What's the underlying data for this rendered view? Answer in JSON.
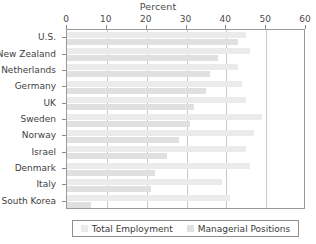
{
  "chart_data": {
    "type": "bar",
    "orientation": "horizontal",
    "title": "Percent",
    "xlabel": "",
    "ylabel": "",
    "xlim": [
      0,
      60
    ],
    "xticks": [
      0,
      10,
      20,
      30,
      40,
      50,
      60
    ],
    "xtick_labels": [
      "0",
      "10",
      "20",
      "30",
      "40",
      "50",
      "60"
    ],
    "grid": true,
    "grid_axis": "x",
    "legend_position": "bottom",
    "categories": [
      "U.S.",
      "New Zealand",
      "Netherlands",
      "Germany",
      "UK",
      "Sweden",
      "Norway",
      "Israel",
      "Denmark",
      "Italy",
      "South Korea"
    ],
    "series": [
      {
        "name": "Total Employment",
        "color": "#ebebeb",
        "values": [
          45,
          46,
          43,
          44,
          45,
          49,
          47,
          45,
          46,
          39,
          41
        ]
      },
      {
        "name": "Managerial Positions",
        "color": "#e0e0e0",
        "values": [
          43,
          38,
          36,
          35,
          32,
          31,
          28,
          25,
          22,
          21,
          6
        ]
      }
    ]
  },
  "legend": {
    "items": [
      {
        "label": "Total Employment",
        "color": "#ebebeb"
      },
      {
        "label": "Managerial Positions",
        "color": "#e0e0e0"
      }
    ]
  }
}
